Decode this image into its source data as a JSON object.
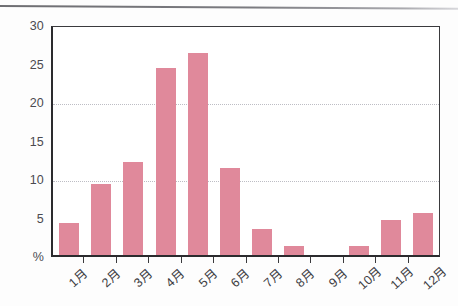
{
  "chart_data": {
    "type": "bar",
    "title": "",
    "subtitle": "",
    "xlabel": "",
    "ylabel": "%",
    "unit_label": "%",
    "categories": [
      "1月",
      "2月",
      "3月",
      "4月",
      "5月",
      "6月",
      "7月",
      "8月",
      "9月",
      "10月",
      "11月",
      "12月"
    ],
    "values": [
      4.1,
      9.2,
      12.1,
      24.3,
      26.2,
      11.3,
      3.4,
      1.2,
      0,
      1.2,
      4.5,
      5.4
    ],
    "series": [
      {
        "name": "",
        "values": [
          4.1,
          9.2,
          12.1,
          24.3,
          26.2,
          11.3,
          3.4,
          1.2,
          0,
          1.2,
          4.5,
          5.4
        ]
      }
    ],
    "ylim": [
      0,
      30
    ],
    "ytick_values": [
      0,
      5,
      10,
      15,
      20,
      25,
      30
    ],
    "ytick_labels": [
      "%",
      "5",
      "10",
      "15",
      "20",
      "25",
      "30"
    ],
    "gridlines": [
      10,
      20
    ],
    "grid": true,
    "legend": false,
    "legend_position": "none",
    "bar_color": "#e0899b",
    "axis_color": "#2b2b2e",
    "grid_color": "#bdbdc4"
  }
}
